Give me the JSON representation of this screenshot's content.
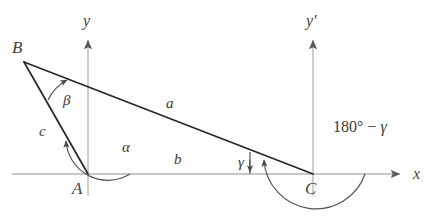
{
  "figure": {
    "type": "geometry-diagram",
    "background_color": "#ffffff",
    "width": 433,
    "height": 224
  },
  "colors": {
    "axis": "#b4b4b4",
    "triangle_side": "#262626",
    "arc": "#555555",
    "text": "#3a3a3a"
  },
  "vertices": [
    {
      "name": "B",
      "label": "B",
      "x": 24,
      "y": 62
    },
    {
      "name": "A",
      "label": "A",
      "x": 88,
      "y": 174
    },
    {
      "name": "C",
      "label": "C",
      "x": 313,
      "y": 174
    }
  ],
  "axes": [
    {
      "name": "x-axis",
      "label": "x",
      "orientation": "horizontal",
      "origin_x": 88,
      "y": 174,
      "start_x": 12,
      "end_x": 402,
      "arrow": "right"
    },
    {
      "name": "y-axis",
      "label": "y",
      "orientation": "vertical",
      "x": 88,
      "start_y": 196,
      "end_y": 38,
      "arrow": "up"
    },
    {
      "name": "y-prime-axis",
      "label": "y'",
      "orientation": "vertical",
      "x": 313,
      "start_y": 196,
      "end_y": 38,
      "arrow": "up"
    }
  ],
  "sides": [
    {
      "name": "side-a",
      "label": "a",
      "from": "B",
      "to": "C",
      "label_x": 166,
      "label_y": 96
    },
    {
      "name": "side-b",
      "label": "b",
      "from": "A",
      "to": "C",
      "label_x": 174,
      "label_y": 152
    },
    {
      "name": "side-c",
      "label": "c",
      "from": "B",
      "to": "A",
      "label_x": 39,
      "label_y": 124
    }
  ],
  "angles": [
    {
      "name": "angle-alpha",
      "label": "α",
      "at_vertex": "A",
      "label_x": 122,
      "label_y": 140,
      "radius": 42
    },
    {
      "name": "angle-beta",
      "label": "β",
      "at_vertex": "B",
      "label_x": 63,
      "label_y": 93,
      "radius": 45
    },
    {
      "name": "angle-gamma",
      "label": "γ",
      "at_vertex": "C",
      "label_x": 238,
      "label_y": 155,
      "radius": 78
    },
    {
      "name": "angle-supplement",
      "label": "180° − γ",
      "at_vertex": "C",
      "label_x": 333,
      "label_y": 119,
      "radius": 52
    }
  ],
  "expression": {
    "degrees_value": "180",
    "degree_symbol": "°",
    "minus_sign": "−",
    "gamma_symbol": "γ"
  }
}
